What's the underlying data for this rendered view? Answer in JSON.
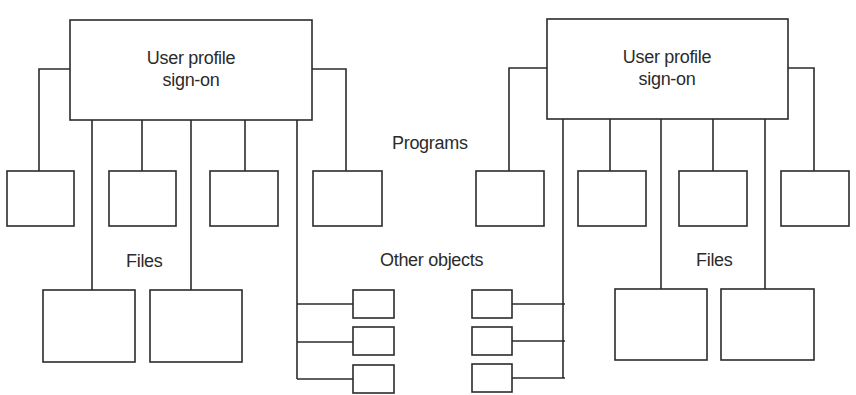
{
  "diagram": {
    "left": {
      "root_label_line1": "User profile",
      "root_label_line2": "sign-on",
      "files_label": "Files",
      "program_boxes": 4,
      "file_boxes": 2,
      "other_object_boxes": 3
    },
    "right": {
      "root_label_line1": "User profile",
      "root_label_line2": "sign-on",
      "files_label": "Files",
      "program_boxes": 4,
      "file_boxes": 2,
      "other_object_boxes": 3
    },
    "center": {
      "programs_label": "Programs",
      "other_objects_label": "Other objects"
    },
    "colors": {
      "stroke": "#2b2b2b",
      "background": "#ffffff"
    }
  }
}
